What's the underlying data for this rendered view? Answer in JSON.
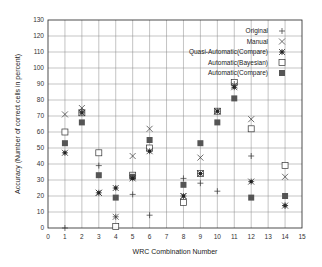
{
  "chart_data": {
    "type": "scatter",
    "title": "",
    "xlabel": "WRC Combination Number",
    "ylabel": "Accuracy (Number of correct cells in percent)",
    "xlim": [
      0,
      15
    ],
    "ylim": [
      0,
      130
    ],
    "xticks": [
      0,
      1,
      2,
      3,
      4,
      5,
      6,
      7,
      8,
      9,
      10,
      11,
      12,
      13,
      14,
      15
    ],
    "yticks": [
      0,
      10,
      20,
      30,
      40,
      50,
      60,
      70,
      80,
      90,
      100,
      110,
      120,
      130
    ],
    "grid": true,
    "legend_position": "top-right",
    "series": [
      {
        "name": "Original",
        "marker": "plus",
        "x": [
          1,
          2,
          3,
          4,
          5,
          6,
          8,
          9,
          10,
          11,
          12,
          14
        ],
        "y": [
          0,
          73,
          39,
          7,
          21,
          8,
          31,
          28,
          23,
          90,
          45,
          14
        ]
      },
      {
        "name": "Manual",
        "marker": "x",
        "x": [
          1,
          2,
          3,
          4,
          5,
          6,
          8,
          9,
          10,
          11,
          12,
          14
        ],
        "y": [
          71,
          75,
          22,
          7,
          45,
          62,
          20,
          44,
          73,
          89,
          68,
          32
        ]
      },
      {
        "name": "Quasi-Automatic(Compare)",
        "marker": "star",
        "x": [
          1,
          2,
          3,
          4,
          5,
          6,
          8,
          9,
          10,
          11,
          12,
          14
        ],
        "y": [
          47,
          72,
          22,
          25,
          31,
          48,
          20,
          34,
          73,
          88,
          29,
          14
        ]
      },
      {
        "name": "Automatic(Bayesian)",
        "marker": "open-square",
        "x": [
          1,
          2,
          3,
          4,
          5,
          6,
          8,
          9,
          10,
          11,
          12,
          14
        ],
        "y": [
          60,
          72,
          47,
          1,
          33,
          50,
          16,
          34,
          73,
          91,
          62,
          39
        ]
      },
      {
        "name": "Automatic(Compare)",
        "marker": "filled-square",
        "x": [
          1,
          2,
          3,
          4,
          5,
          6,
          8,
          9,
          10,
          11,
          12,
          14
        ],
        "y": [
          53,
          66,
          33,
          19,
          32,
          55,
          27,
          53,
          66,
          81,
          19,
          20
        ]
      }
    ]
  },
  "colors": {
    "axis": "#222222",
    "grid": "#888888",
    "marker": "#333333",
    "filled": "#555555"
  }
}
